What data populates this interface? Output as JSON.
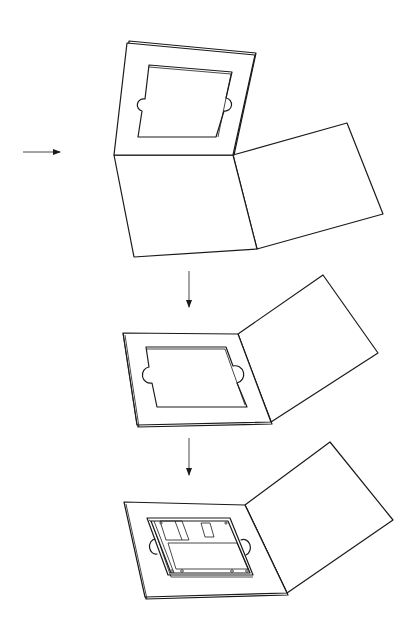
{
  "figure": {
    "stroke_color": "#1a1a1a",
    "background": "#ffffff",
    "steps": [
      {
        "name": "step-1-open-folder-with-raised-frame"
      },
      {
        "name": "step-2-frame-folded-flat"
      },
      {
        "name": "step-3-disk-inserted"
      }
    ],
    "arrows": [
      {
        "name": "side-arrow",
        "direction": "right"
      },
      {
        "name": "down-arrow-1",
        "direction": "down"
      },
      {
        "name": "down-arrow-2",
        "direction": "down"
      }
    ]
  }
}
